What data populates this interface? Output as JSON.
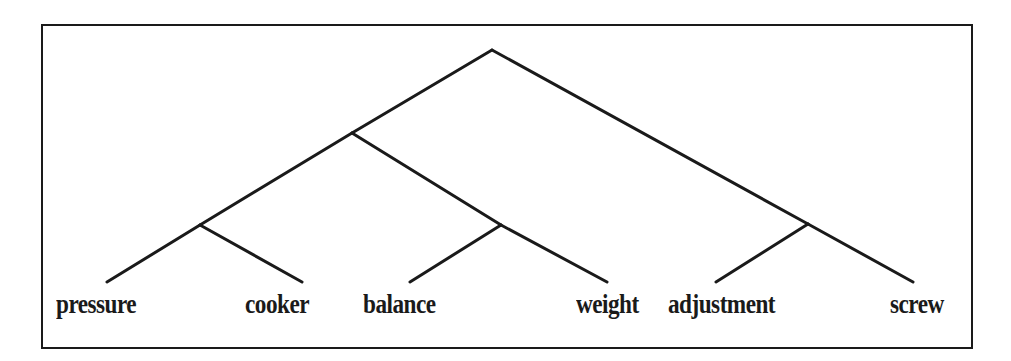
{
  "diagram": {
    "type": "binary-constituency-tree",
    "line_color": "#1a1a1a",
    "frame_color": "#1a1a1a",
    "nodes": [
      {
        "id": "root",
        "x": 492,
        "y": 50
      },
      {
        "id": "n_pressure_cooker_balance_weight",
        "x": 352,
        "y": 133
      },
      {
        "id": "n_pressure_cooker",
        "x": 200,
        "y": 225
      },
      {
        "id": "n_balance_weight",
        "x": 501,
        "y": 225
      },
      {
        "id": "n_adjustment_screw",
        "x": 808,
        "y": 224
      }
    ],
    "leaves": [
      {
        "id": "leaf0",
        "label": "pressure",
        "end_x": 107,
        "end_y": 282,
        "label_x": 56
      },
      {
        "id": "leaf1",
        "label": "cooker",
        "end_x": 302,
        "end_y": 282,
        "label_x": 245
      },
      {
        "id": "leaf2",
        "label": "balance",
        "end_x": 410,
        "end_y": 282,
        "label_x": 363
      },
      {
        "id": "leaf3",
        "label": "weight",
        "end_x": 607,
        "end_y": 282,
        "label_x": 576
      },
      {
        "id": "leaf4",
        "label": "adjustment",
        "end_x": 716,
        "end_y": 282,
        "label_x": 668
      },
      {
        "id": "leaf5",
        "label": "screw",
        "end_x": 913,
        "end_y": 282,
        "label_x": 890
      }
    ],
    "edges": [
      {
        "from": "root",
        "to": "n_pressure_cooker_balance_weight"
      },
      {
        "from": "root",
        "to": "n_adjustment_screw"
      },
      {
        "from": "n_pressure_cooker_balance_weight",
        "to": "n_pressure_cooker"
      },
      {
        "from": "n_pressure_cooker_balance_weight",
        "to": "n_balance_weight"
      },
      {
        "from": "n_pressure_cooker",
        "to": "leaf0"
      },
      {
        "from": "n_pressure_cooker",
        "to": "leaf1"
      },
      {
        "from": "n_balance_weight",
        "to": "leaf2"
      },
      {
        "from": "n_balance_weight",
        "to": "leaf3"
      },
      {
        "from": "n_adjustment_screw",
        "to": "leaf4"
      },
      {
        "from": "n_adjustment_screw",
        "to": "leaf5"
      }
    ],
    "structure": "(((pressure cooker) (balance weight)) (adjustment screw))"
  }
}
